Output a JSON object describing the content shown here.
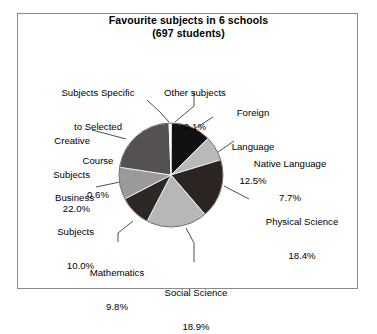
{
  "chart_data": {
    "type": "pie",
    "title": "Favourite subjects in 6 schools",
    "subtitle": "(697 students)",
    "title_line1": "Favourite subjects in 6 schools",
    "title_line2": "(697 students)",
    "total_students": 697,
    "units": "percent",
    "start_angle_deg": 0,
    "direction": "clockwise",
    "legend": "none (direct labels with leader lines)",
    "categories": [
      "Other subjects",
      "Foreign Language",
      "Native Language",
      "Physical Science",
      "Social Science",
      "Mathematics",
      "Business Subjects",
      "Creative Subjects",
      "Subjects Specific to Selected Course"
    ],
    "values": [
      0.1,
      12.5,
      7.7,
      18.4,
      18.9,
      9.8,
      10.0,
      22.0,
      0.6
    ],
    "slices": [
      {
        "label": "Other subjects",
        "label_line1": "Other subjects",
        "label_line2": "0.1%",
        "value": 0.1,
        "pct_text": "0.1%",
        "color": "#f2f2f2"
      },
      {
        "label": "Foreign Language",
        "label_line1": "Foreign",
        "label_line2": "Language",
        "label_line3": "12.5%",
        "value": 12.5,
        "pct_text": "12.5%",
        "color": "#111111"
      },
      {
        "label": "Native Language",
        "label_line1": "Native Language",
        "label_line2": "7.7%",
        "value": 7.7,
        "pct_text": "7.7%",
        "color": "#b9b9b9"
      },
      {
        "label": "Physical Science",
        "label_line1": "Physical Science",
        "label_line2": "18.4%",
        "value": 18.4,
        "pct_text": "18.4%",
        "color": "#2b2421"
      },
      {
        "label": "Social Science",
        "label_line1": "Social Science",
        "label_line2": "18.9%",
        "value": 18.9,
        "pct_text": "18.9%",
        "color": "#b7b7b7"
      },
      {
        "label": "Mathematics",
        "label_line1": "Mathematics",
        "label_line2": "9.8%",
        "value": 9.8,
        "pct_text": "9.8%",
        "color": "#2e2724"
      },
      {
        "label": "Business Subjects",
        "label_line1": "Business",
        "label_line2": "Subjects",
        "label_line3": "10.0%",
        "value": 10.0,
        "pct_text": "10.0%",
        "color": "#9a9a9a"
      },
      {
        "label": "Creative Subjects",
        "label_line1": "Creative",
        "label_line2": "Subjects",
        "label_line3": "22.0%",
        "value": 22.0,
        "pct_text": "22.0%",
        "color": "#555150"
      },
      {
        "label": "Subjects Specific to Selected Course",
        "label_line1": "Subjects Specific",
        "label_line2": "to Selected",
        "label_line3": "Course",
        "label_line4": "0.6%",
        "value": 0.6,
        "pct_text": "0.6%",
        "color": "#ffffff"
      }
    ]
  },
  "labels": {
    "subjects_specific": {
      "l1": "Subjects Specific",
      "l2": "to Selected",
      "l3": "Course",
      "l4": "0.6%"
    },
    "other_subjects": {
      "l1": "Other subjects",
      "l2": "0.1%"
    },
    "foreign_language": {
      "l1": "Foreign",
      "l2": "Language",
      "l3": "12.5%"
    },
    "native_language": {
      "l1": "Native Language",
      "l2": "7.7%"
    },
    "physical_science": {
      "l1": "Physical Science",
      "l2": "18.4%"
    },
    "social_science": {
      "l1": "Social Science",
      "l2": "18.9%"
    },
    "mathematics": {
      "l1": "Mathematics",
      "l2": "9.8%"
    },
    "business_subjects": {
      "l1": "Business",
      "l2": "Subjects",
      "l3": "10.0%"
    },
    "creative_subjects": {
      "l1": "Creative",
      "l2": "Subjects",
      "l3": "22.0%"
    }
  },
  "colors": {
    "frame_border": "#8a8a8a",
    "background": "#ffffff",
    "text": "#000000",
    "leader_line": "#3a3a3a"
  }
}
